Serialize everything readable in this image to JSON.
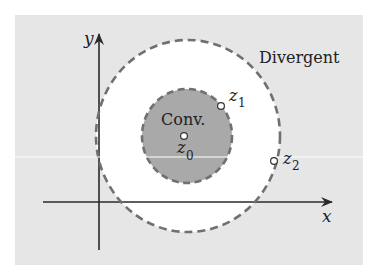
{
  "diagram": {
    "colors": {
      "page_background": "#ffffff",
      "panel_background": "#e6e6e6",
      "annulus_fill": "#ffffff",
      "convergence_fill": "#a9a9a9",
      "dash_stroke": "#707070",
      "axis_stroke": "#2a2a2a",
      "text": "#222222",
      "scan_line": "#ffffff"
    },
    "axes": {
      "x_label": "x",
      "y_label": "y"
    },
    "regions": {
      "divergent_label": "Divergent",
      "convergent_label": "Conv."
    },
    "points": [
      {
        "name": "z0",
        "symbol": "z",
        "subscript": "0",
        "cx": 184,
        "cy": 136
      },
      {
        "name": "z1",
        "symbol": "z",
        "subscript": "1",
        "cx": 221,
        "cy": 106
      },
      {
        "name": "z2",
        "symbol": "z",
        "subscript": "2",
        "cx": 274,
        "cy": 161
      }
    ],
    "circles": {
      "inner": {
        "cx": 187,
        "cy": 136,
        "rx": 45,
        "ry": 47,
        "style": "dashed"
      },
      "outer": {
        "cx": 188,
        "cy": 136,
        "rx": 92,
        "ry": 96,
        "style": "dashed"
      }
    }
  }
}
